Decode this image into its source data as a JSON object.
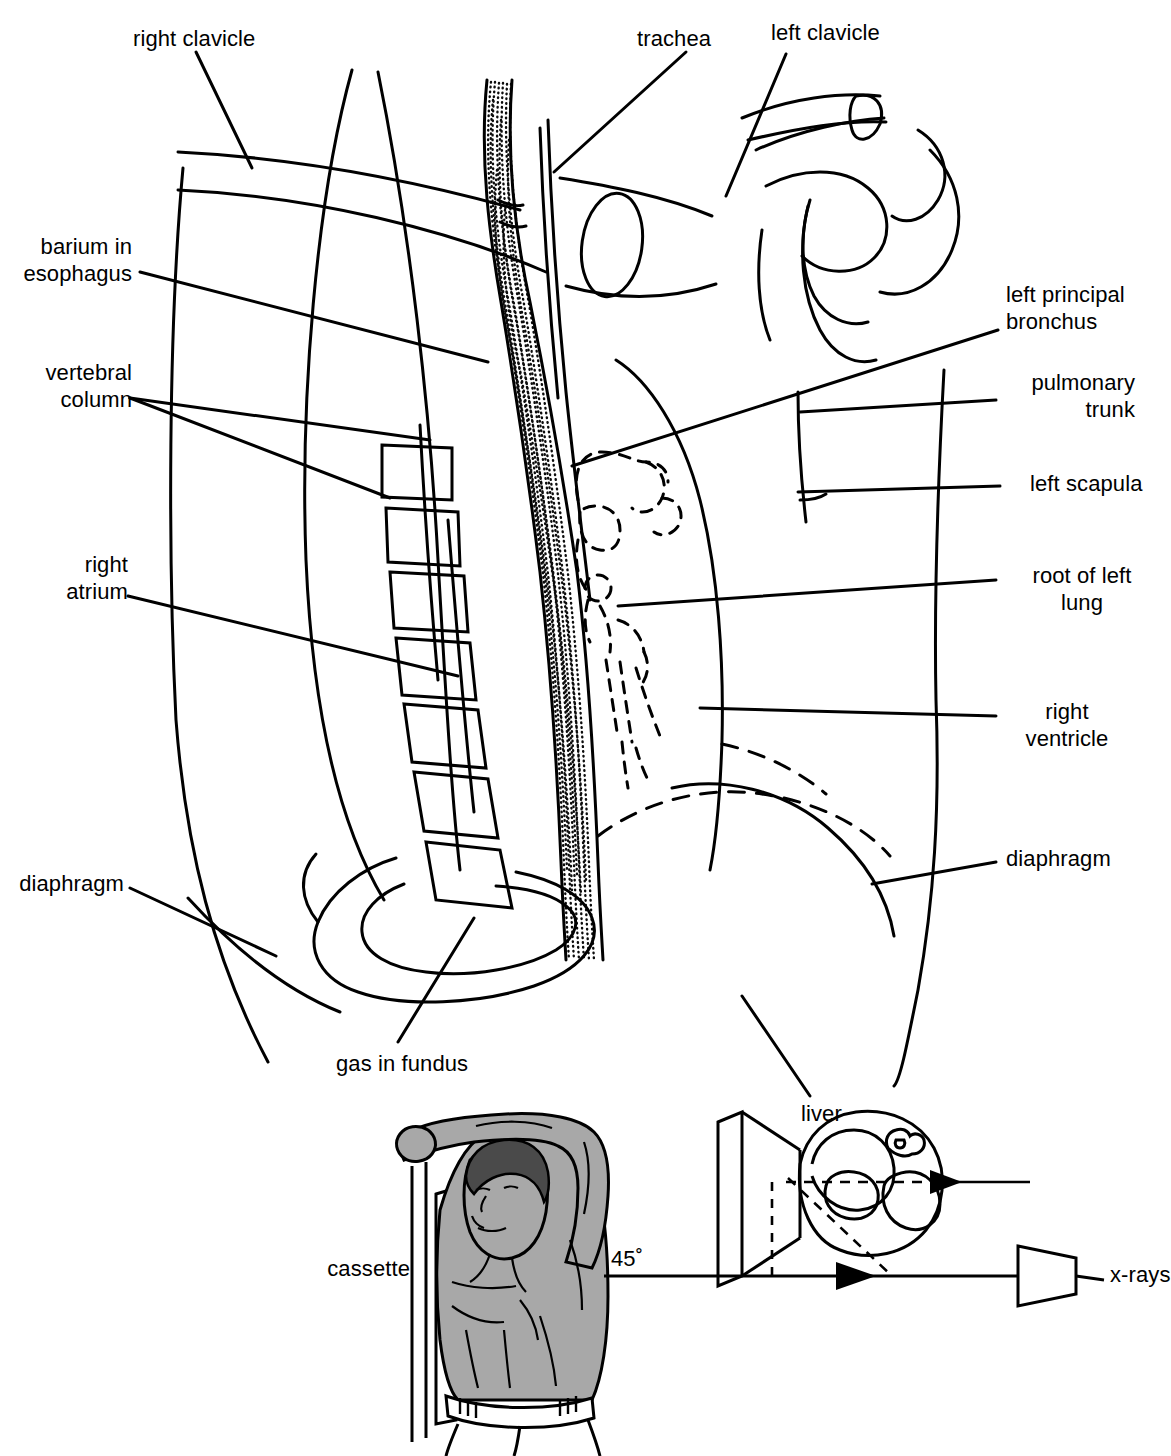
{
  "figure": {
    "type": "anatomical-line-diagram",
    "background_color": "#ffffff",
    "line_color": "#000000",
    "skin_fill_color": "#a8a8a8",
    "hair_fill_color": "#4a4a4a"
  },
  "labels": {
    "right_clavicle": "right clavicle",
    "trachea": "trachea",
    "left_clavicle": "left clavicle",
    "barium_in_esophagus": "barium in\nesophagus",
    "left_principal_bronchus": "left principal\nbronchus",
    "vertebral_column": "vertebral\ncolumn",
    "pulmonary_trunk": "pulmonary\ntrunk",
    "left_scapula": "left scapula",
    "right_atrium": "right\natrium",
    "root_of_left_lung": "root of left\nlung",
    "right_ventricle": "right\nventricle",
    "diaphragm_left": "diaphragm",
    "diaphragm_right": "diaphragm",
    "gas_in_fundus": "gas in fundus",
    "liver": "liver",
    "cassette": "cassette",
    "angle": "45˚",
    "xrays": "x-rays"
  },
  "inset": {
    "caption_items": [
      "cassette",
      "45˚",
      "x-rays"
    ],
    "angle_value": "45˚",
    "description": "Patient standing at 45 degrees against cassette, x-ray beam from the right"
  }
}
